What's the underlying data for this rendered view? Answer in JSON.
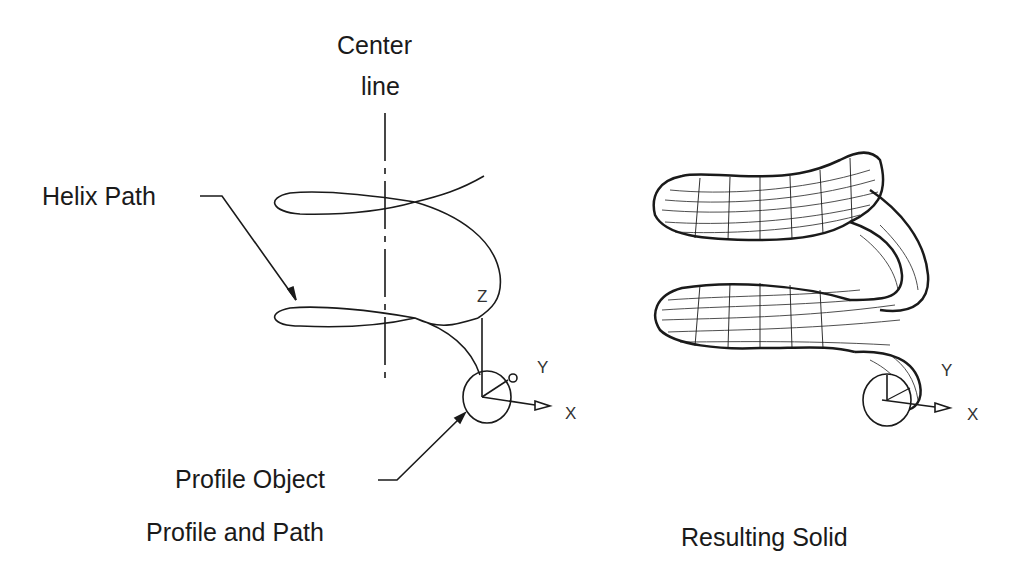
{
  "left_panel": {
    "caption": "Profile and Path",
    "labels": {
      "center_line_1": "Center",
      "center_line_2": "line",
      "helix_path": "Helix Path",
      "profile_object": "Profile Object"
    },
    "axes": {
      "z": "Z",
      "y": "Y",
      "x": "X"
    }
  },
  "right_panel": {
    "caption": "Resulting Solid",
    "axes": {
      "y": "Y",
      "x": "X"
    }
  },
  "colors": {
    "ink": "#1a1a1a",
    "background": "#ffffff"
  }
}
